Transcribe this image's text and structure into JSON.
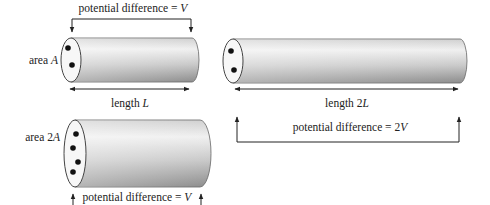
{
  "diagram": {
    "cylinder_1": {
      "area_label": "area ",
      "area_var": "A",
      "length_label": "length ",
      "length_var": "L",
      "pd_label": "potential difference = ",
      "pd_var": "V",
      "charge_dots": 2
    },
    "cylinder_2": {
      "length_label": "length 2",
      "length_var": "L",
      "pd_label": "potential difference = 2",
      "pd_var": "V",
      "charge_dots": 2
    },
    "cylinder_3": {
      "area_label": "area 2",
      "area_var": "A",
      "pd_label": "potential difference = ",
      "pd_var": "V",
      "charge_dots": 4
    },
    "colors": {
      "cylinder_light": "#f2f2f2",
      "cylinder_dark": "#8e8e8e",
      "endcap": "#f7f7f7",
      "line": "#222222",
      "dot": "#111111"
    }
  }
}
